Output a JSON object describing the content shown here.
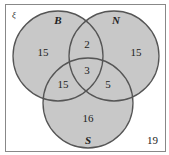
{
  "universal_label": "ξ",
  "sets": [
    {
      "name": "B",
      "cx": 58,
      "cy": 56,
      "r": 45
    },
    {
      "name": "N",
      "cx": 114,
      "cy": 56,
      "r": 45
    },
    {
      "name": "S",
      "cx": 88,
      "cy": 103,
      "r": 45
    }
  ],
  "regions": {
    "B_only": "15",
    "N_only": "15",
    "S_only": "16",
    "B_N": "2",
    "B_S": "15",
    "N_S": "5",
    "B_N_S": "3",
    "outside": "19"
  },
  "colors": {
    "fill": "#c8c8c8",
    "stroke": "#555555",
    "frame": "#888888"
  }
}
